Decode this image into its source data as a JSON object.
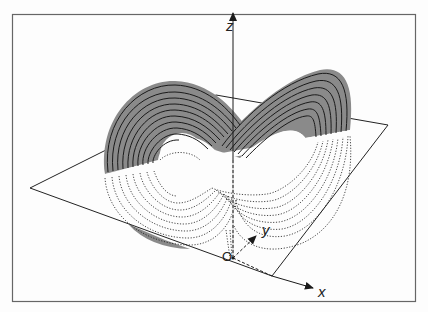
{
  "figure": {
    "axes": {
      "z_label": "z",
      "y_label": "y",
      "x_label": "x",
      "origin_label": "O"
    },
    "colors": {
      "frame": "#555555",
      "shade": "#8a8a8a",
      "line": "#1a1a1a",
      "background": "#fdfdfd"
    }
  }
}
